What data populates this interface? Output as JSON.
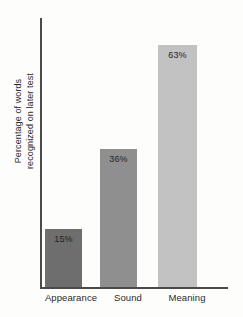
{
  "chart_data": {
    "type": "bar",
    "title": "",
    "xlabel": "",
    "ylabel": "Percentage of words recognized on later test",
    "ylabel_line1": "Percentage of words",
    "ylabel_line2": "recognized on later test",
    "categories": [
      "Appearance",
      "Sound",
      "Meaning"
    ],
    "values": [
      15,
      36,
      63
    ],
    "value_labels": [
      "15%",
      "36%",
      "63%"
    ],
    "ylim": [
      0,
      70
    ],
    "grid": false,
    "legend": "none",
    "bar_colors": [
      "#6e6e6e",
      "#8f8f8f",
      "#c2c2c2"
    ],
    "axis_color": "#4a4a4a",
    "text_color": "#2b2b2b",
    "background": "#fdfdfc"
  }
}
